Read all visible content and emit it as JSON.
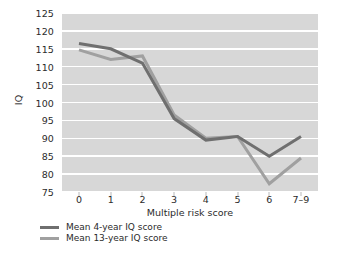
{
  "chart_data": {
    "type": "line",
    "title": "",
    "xlabel": "Multiple risk score",
    "ylabel": "IQ",
    "categories": [
      "0",
      "1",
      "2",
      "3",
      "4",
      "5",
      "6",
      "7–9"
    ],
    "ylim": [
      75,
      125
    ],
    "yticks": [
      125,
      120,
      115,
      110,
      105,
      100,
      95,
      90,
      85,
      80,
      75
    ],
    "grid": "horizontal-white",
    "legend_position": "below-left",
    "plot_background": "#d7d7d7",
    "series": [
      {
        "name": "Mean 4-year IQ score",
        "color": "#6f6f6f",
        "values": [
          116.5,
          115.0,
          111.0,
          95.5,
          89.5,
          90.5,
          85.0,
          90.5
        ]
      },
      {
        "name": "Mean 13-year IQ score",
        "color": "#a0a0a0",
        "values": [
          114.7,
          112.0,
          113.0,
          96.5,
          90.0,
          90.5,
          77.3,
          84.5
        ]
      }
    ]
  },
  "axes": {
    "y_title": "IQ",
    "x_title": "Multiple risk score",
    "y_tick_labels": [
      "125",
      "120",
      "115",
      "110",
      "105",
      "100",
      "95",
      "90",
      "85",
      "80",
      "75"
    ],
    "x_tick_labels": [
      "0",
      "1",
      "2",
      "3",
      "4",
      "5",
      "6",
      "7–9"
    ]
  },
  "legend": {
    "items": [
      {
        "label": "Mean 4-year IQ score",
        "color": "#6f6f6f"
      },
      {
        "label": "Mean 13-year IQ score",
        "color": "#a0a0a0"
      }
    ]
  },
  "colors": {
    "plot_background": "#d7d7d7",
    "gridline": "#ffffff",
    "series_4_year": "#6f6f6f",
    "series_13_year": "#a0a0a0",
    "text": "#2b2b2b",
    "page_background": "#ffffff"
  }
}
